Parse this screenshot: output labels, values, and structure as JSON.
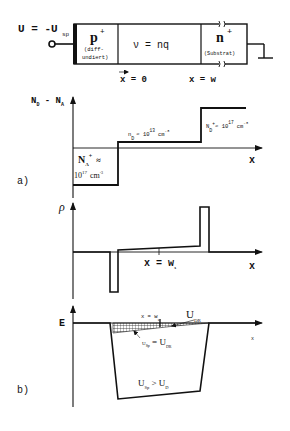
{
  "device": {
    "voltage_label": "U = -U",
    "voltage_sub": "sp",
    "p_region": {
      "label": "p",
      "sup": "+",
      "note_line1": "(diff-",
      "note_line2": "undiert)"
    },
    "intrinsic_region": {
      "label": "ν = nq"
    },
    "n_region": {
      "label": "n",
      "sup": "+",
      "note": "(Substrat)"
    },
    "pos_x0": "x = 0",
    "pos_xw": "x = w"
  },
  "panel_a": {
    "tag": "a)",
    "y_axis_label": "N",
    "y_axis_sub1": "D",
    "y_axis_mid": " - N",
    "y_axis_sub2": "A",
    "x_axis_label": "x",
    "na_label": "N",
    "na_sub": "A",
    "na_sup": "+",
    "na_approx": "≈",
    "na_value": "10",
    "na_exp": "17",
    "na_unit": "cm",
    "na_unit_exp": "-3",
    "nd_label": "n",
    "nd_sub": "D",
    "nd_value": "≈ 10",
    "nd_exp": "13",
    "nd_unit": "cm",
    "nd_unit_exp": "-3",
    "ndp_label": "N",
    "ndp_sub": "D",
    "ndp_sup": "+",
    "ndp_value": "≈ 10",
    "ndp_exp": "17",
    "ndp_unit": "cm",
    "ndp_unit_exp": "-3"
  },
  "panel_rho": {
    "y_axis_label": "ρ",
    "x_axis_label": "x",
    "marker_label": "x = w",
    "marker_sub": "1"
  },
  "panel_b": {
    "tag": "b)",
    "y_axis_label": "E",
    "x_axis_label": "x",
    "marker_label": "x  =  w",
    "marker_sub": "1",
    "udr_label": "U",
    "udr_sub": "DR",
    "usp_eq_label_u": "U",
    "usp_eq_sub": "Sp",
    "usp_eq_mid": " = U",
    "usp_eq_sub2": "DR",
    "usp_gt_label_u": "U",
    "usp_gt_sub": "Sp",
    "usp_gt_mid": " > U",
    "usp_gt_sub2": "D"
  }
}
